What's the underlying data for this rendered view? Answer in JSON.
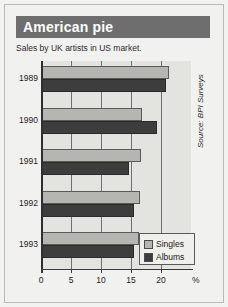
{
  "header": {
    "title": "American pie",
    "subtitle": "Sales by UK artists in US market."
  },
  "source_note": "Source: BPI Surveys",
  "colors": {
    "title_bar": "#6e6e6e",
    "title_text": "#ffffff",
    "plot_background": "#e3e3e0",
    "singles": "#b5b5b2",
    "albums": "#3d3d3d",
    "gridline": "#6f6f6f",
    "axis": "#2f2f2f",
    "page_background": "#f1f1ef"
  },
  "axis": {
    "x_ticks": [
      "0",
      "5",
      "10",
      "15",
      "20"
    ],
    "x_unit_label": "%",
    "y_categories": [
      "1989",
      "1990",
      "1991",
      "1992",
      "1993"
    ]
  },
  "legend": {
    "position": "bottom-right",
    "entries": [
      {
        "label": "Singles",
        "color": "#b5b5b2"
      },
      {
        "label": "Albums",
        "color": "#3d3d3d"
      }
    ]
  },
  "chart_data": {
    "type": "bar",
    "orientation": "horizontal",
    "title": "American pie",
    "subtitle": "Sales by UK artists in US market.",
    "xlabel": "%",
    "ylabel": "",
    "categories": [
      "1989",
      "1990",
      "1991",
      "1992",
      "1993"
    ],
    "series": [
      {
        "name": "Singles",
        "color": "#b5b5b2",
        "values": [
          21.3,
          16.8,
          16.7,
          16.5,
          16.3
        ]
      },
      {
        "name": "Albums",
        "color": "#3d3d3d",
        "values": [
          20.8,
          19.4,
          14.7,
          15.5,
          15.5
        ]
      }
    ],
    "xlim": [
      0,
      25
    ],
    "xticks": [
      0,
      5,
      10,
      15,
      20
    ],
    "grid": true,
    "grid_axis": "x",
    "legend_position": "bottom-right",
    "annotations": [
      "Source: BPI Surveys"
    ]
  }
}
